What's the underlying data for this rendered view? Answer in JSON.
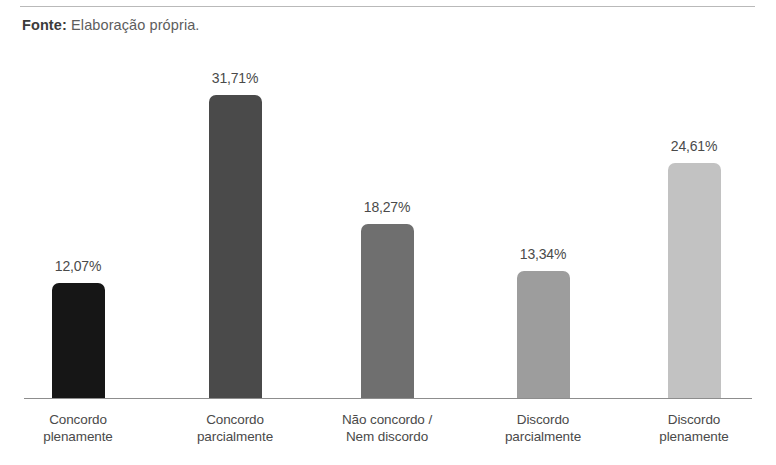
{
  "source": {
    "label": "Fonte:",
    "text": "Elaboração própria."
  },
  "chart_data": {
    "type": "bar",
    "title": "",
    "subtitle": "",
    "xlabel": "",
    "ylabel": "",
    "ylim": [
      0,
      35
    ],
    "grid": false,
    "legend": "none",
    "axis": {
      "baseline": true,
      "value_suffix": "%",
      "decimal_separator": ","
    },
    "categories": [
      "Concordo plenamente",
      "Concordo parcialmente",
      "Não concordo / Nem discordo",
      "Discordo parcialmente",
      "Discordo plenamente"
    ],
    "category_lines": [
      [
        "Concordo",
        "plenamente"
      ],
      [
        "Concordo",
        "parcialmente"
      ],
      [
        "Não concordo /",
        "Nem discordo"
      ],
      [
        "Discordo",
        "parcialmente"
      ],
      [
        "Discordo",
        "plenamente"
      ]
    ],
    "values": [
      12.07,
      31.71,
      18.27,
      13.34,
      24.61
    ],
    "value_labels": [
      "12,07%",
      "31,71%",
      "18,27%",
      "13,34%",
      "24,61%"
    ],
    "colors": [
      "#161616",
      "#4a4a4a",
      "#6f6f6f",
      "#9d9d9d",
      "#c2c2c2"
    ],
    "bar_centers_px": [
      78,
      235,
      387,
      543,
      694
    ],
    "bar_width_px": 53
  }
}
